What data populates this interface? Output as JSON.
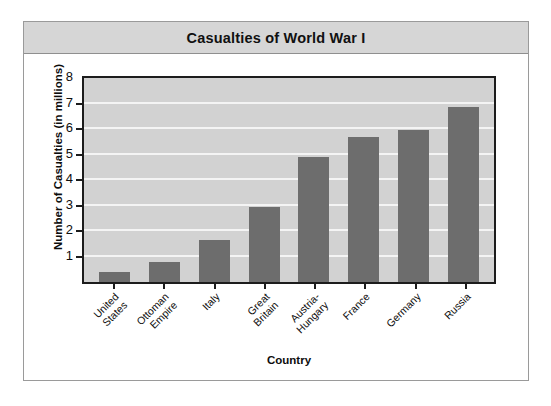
{
  "card": {
    "title": "Casualties of World War I"
  },
  "chart_data": {
    "type": "bar",
    "title": "Casualties of World War I",
    "xlabel": "Country",
    "ylabel": "Number of Casualties (in millions)",
    "categories": [
      "United States",
      "Ottoman Empire",
      "Italy",
      "Great Britain",
      "Austria-Hungary",
      "France",
      "Germany",
      "Russia"
    ],
    "category_lines": [
      [
        "United",
        "States"
      ],
      [
        "Ottoman",
        "Empire"
      ],
      [
        "Italy",
        ""
      ],
      [
        "Great",
        "Britain"
      ],
      [
        "Austria-",
        "Hungary"
      ],
      [
        "France",
        ""
      ],
      [
        "Germany",
        ""
      ],
      [
        "Russia",
        ""
      ]
    ],
    "values": [
      0.4,
      0.8,
      1.65,
      2.95,
      4.9,
      5.7,
      5.95,
      6.85
    ],
    "ylim": [
      0,
      8
    ],
    "ytick_labels": [
      "1",
      "2",
      "3",
      "4",
      "5",
      "6",
      "7",
      "8"
    ],
    "ytick_values": [
      1,
      2,
      3,
      4,
      5,
      6,
      7,
      8
    ],
    "grid": true,
    "legend": "none",
    "colors": {
      "bar": "#6d6d6d",
      "plot_background": "#d2d2d2",
      "gridline": "#f4f4f4",
      "axis": "#1c1c1c",
      "title_band": "#d6d6d6",
      "card_border": "#9a9a9a"
    }
  }
}
